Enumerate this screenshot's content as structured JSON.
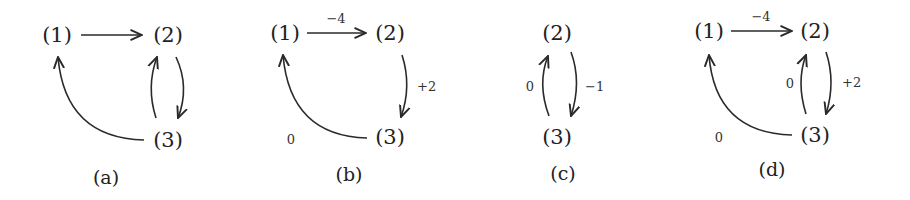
{
  "diagrams": [
    {
      "caption": "(a)",
      "nodes": {
        "n1": "(1)",
        "n2": "(2)",
        "n3": "(3)"
      },
      "edges": [
        {
          "from": "1",
          "to": "2",
          "weight": ""
        },
        {
          "from": "2",
          "to": "3",
          "weight": ""
        },
        {
          "from": "3",
          "to": "2",
          "weight": ""
        },
        {
          "from": "3",
          "to": "1",
          "weight": ""
        }
      ]
    },
    {
      "caption": "(b)",
      "nodes": {
        "n1": "(1)",
        "n2": "(2)",
        "n3": "(3)"
      },
      "edges": [
        {
          "from": "1",
          "to": "2",
          "weight": "−4"
        },
        {
          "from": "2",
          "to": "3",
          "weight": "+2"
        },
        {
          "from": "3",
          "to": "1",
          "weight": "0"
        }
      ]
    },
    {
      "caption": "(c)",
      "nodes": {
        "n2": "(2)",
        "n3": "(3)"
      },
      "edges": [
        {
          "from": "2",
          "to": "3",
          "weight": "−1"
        },
        {
          "from": "3",
          "to": "2",
          "weight": "0"
        }
      ]
    },
    {
      "caption": "(d)",
      "nodes": {
        "n1": "(1)",
        "n2": "(2)",
        "n3": "(3)"
      },
      "edges": [
        {
          "from": "1",
          "to": "2",
          "weight": "−4"
        },
        {
          "from": "2",
          "to": "3",
          "weight": "+2"
        },
        {
          "from": "3",
          "to": "2",
          "weight": "0"
        },
        {
          "from": "3",
          "to": "1",
          "weight": "0"
        }
      ]
    }
  ]
}
